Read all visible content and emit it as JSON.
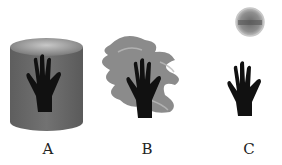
{
  "figure": {
    "panels": [
      {
        "label": "A",
        "description": "hand inside gray cylinder"
      },
      {
        "label": "B",
        "description": "hand with smoke-like swirls"
      },
      {
        "label": "C",
        "description": "hand with sphere above"
      }
    ]
  },
  "colors": {
    "hand": "#111111",
    "cylinder_body": "#6e6e6e",
    "cylinder_top": "#a0a0a0",
    "smoke": "#7a7a7a",
    "sphere": "#8a8a8a"
  }
}
